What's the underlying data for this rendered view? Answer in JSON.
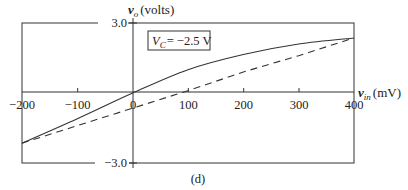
{
  "chart_data": {
    "type": "line",
    "title": "",
    "panel_label": "(d)",
    "annotation": "V_C = −2.5 V",
    "xlabel": "v_in (mV)",
    "ylabel": "v_o (volts)",
    "xlim": [
      -200,
      400
    ],
    "ylim": [
      -3.0,
      3.0
    ],
    "x_ticks": [
      -200,
      -100,
      0,
      100,
      200,
      300,
      400
    ],
    "x_tick_labels": [
      "−200",
      "−100",
      "0",
      "100",
      "200",
      "300",
      "400"
    ],
    "y_tick_labels": [
      "3.0",
      "−3.0"
    ],
    "grid": false,
    "legend": null,
    "series": [
      {
        "name": "solid",
        "style": "solid",
        "x": [
          -200,
          -100,
          0,
          100,
          200,
          300,
          400
        ],
        "values": [
          -2.15,
          -1.1,
          0.0,
          1.0,
          1.65,
          2.1,
          2.36
        ]
      },
      {
        "name": "dashed",
        "style": "dashed",
        "x": [
          -200,
          -100,
          0,
          100,
          200,
          300,
          400
        ],
        "values": [
          -2.15,
          -1.4,
          -0.65,
          0.1,
          0.9,
          1.6,
          2.36
        ]
      }
    ]
  },
  "labels": {
    "ylabel_var": "v",
    "ylabel_sub": "o",
    "ylabel_unit": "(volts)",
    "xlabel_var": "v",
    "xlabel_sub": "in",
    "xlabel_unit": "(mV)",
    "ymax": "3.0",
    "ymin": "−3.0",
    "annot_var": "V",
    "annot_sub": "C",
    "annot_val": "= −2.5 V",
    "panel": "(d)",
    "xt0": "−200",
    "xt1": "−100",
    "xt2": "0",
    "xt3": "100",
    "xt4": "200",
    "xt5": "300",
    "xt6": "400"
  }
}
